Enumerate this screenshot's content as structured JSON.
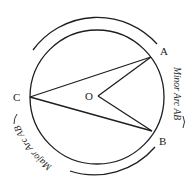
{
  "diagram": {
    "title": "",
    "circle": {
      "cx": 97,
      "cy": 97,
      "r": 67
    },
    "outer_arc_radius": 80,
    "points": {
      "A": {
        "label": "A",
        "x": 151,
        "y": 57,
        "label_x": 160,
        "label_y": 55
      },
      "B": {
        "label": "B",
        "x": 152,
        "y": 131,
        "label_x": 159,
        "label_y": 145
      },
      "C": {
        "label": "C",
        "x": 30,
        "y": 97,
        "label_x": 14,
        "label_y": 101
      },
      "O": {
        "label": "O",
        "x": 98,
        "y": 96,
        "label_x": 86,
        "label_y": 100
      }
    },
    "segments": [
      "CA",
      "CB",
      "OA",
      "OB"
    ],
    "arc_labels": {
      "minor": {
        "prefix": "Minor Arc ",
        "arc": "AB"
      },
      "major": {
        "prefix": "Major Arc ",
        "arc": "AB"
      }
    },
    "colors": {
      "stroke": "#1e1e1e",
      "background": "#ffffff"
    }
  }
}
